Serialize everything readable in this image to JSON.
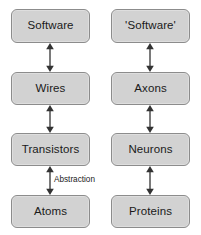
{
  "diagram": {
    "background_color": "#ffffff",
    "node_fill_color": "#d2d2d2",
    "node_border_color": "#8c8c8c",
    "text_color": "#1a1a1a",
    "arrow_color": "#595959",
    "columns": [
      {
        "name": "computer-column",
        "nodes": [
          {
            "id": "software",
            "label": "Software"
          },
          {
            "id": "wires",
            "label": "Wires"
          },
          {
            "id": "transistors",
            "label": "Transistors"
          },
          {
            "id": "atoms",
            "label": "Atoms"
          }
        ],
        "connectors": [
          {
            "id": "software-wires",
            "style": "double-headed-arrow",
            "label": ""
          },
          {
            "id": "wires-transistors",
            "style": "double-headed-arrow",
            "label": ""
          },
          {
            "id": "transistors-atoms",
            "style": "double-headed-arrow",
            "label": "Abstraction"
          }
        ]
      },
      {
        "name": "brain-column",
        "nodes": [
          {
            "id": "software-quoted",
            "label": "'Software'"
          },
          {
            "id": "axons",
            "label": "Axons"
          },
          {
            "id": "neurons",
            "label": "Neurons"
          },
          {
            "id": "proteins",
            "label": "Proteins"
          }
        ],
        "connectors": [
          {
            "id": "software-quoted-axons",
            "style": "double-headed-arrow",
            "label": ""
          },
          {
            "id": "axons-neurons",
            "style": "double-headed-arrow",
            "label": ""
          },
          {
            "id": "neurons-proteins",
            "style": "double-headed-arrow",
            "label": ""
          }
        ]
      }
    ]
  }
}
